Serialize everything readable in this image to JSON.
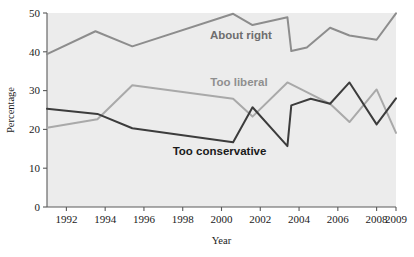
{
  "chart_data": {
    "type": "line",
    "title": "",
    "subtitle": "",
    "xlabel": "Year",
    "ylabel": "Percentage",
    "xlim": [
      1991,
      2009
    ],
    "ylim": [
      0,
      50
    ],
    "xticks": [
      1992,
      1994,
      1996,
      1998,
      2000,
      2002,
      2004,
      2006,
      2008,
      2009
    ],
    "yticks": [
      0,
      10,
      20,
      30,
      40,
      50
    ],
    "xtick_labels": [
      "1992",
      "1994",
      "1996",
      "1998",
      "2000",
      "2002",
      "2004",
      "2006",
      "2008",
      "2009"
    ],
    "ytick_labels": [
      "0",
      "10",
      "20",
      "30",
      "40",
      "50"
    ],
    "grid": false,
    "legend_position": "inline-annotations",
    "plot_background": "#ececec",
    "series": [
      {
        "name": "About right",
        "color": "#8d8d8d",
        "label_color": "#6e6e6e",
        "x": [
          1991,
          1993.5,
          1995.4,
          2000.6,
          2001.6,
          2003.4,
          2003.6,
          2004.4,
          2005.6,
          2006.6,
          2008,
          2009
        ],
        "values": [
          39.4,
          45.3,
          41.4,
          49.8,
          46.9,
          48.9,
          40.2,
          41.1,
          46.2,
          44.2,
          43.1,
          49.9
        ]
      },
      {
        "name": "Too liberal",
        "color": "#a9a9a9",
        "label_color": "#8f8f8f",
        "x": [
          1991,
          1993.6,
          1995.4,
          2000.6,
          2001.6,
          2003.4,
          2005.6,
          2006.6,
          2008,
          2009
        ],
        "values": [
          20.4,
          22.6,
          31.4,
          27.9,
          23.3,
          32.1,
          26.6,
          21.9,
          30.3,
          19.1
        ]
      },
      {
        "name": "Too conservative",
        "color": "#3c3c3c",
        "label_color": "#1a1a1a",
        "x": [
          1991,
          1993.6,
          1995.4,
          2000.6,
          2001.6,
          2003.4,
          2003.6,
          2004.6,
          2005.6,
          2006.6,
          2008,
          2009
        ],
        "values": [
          25.3,
          24.0,
          20.3,
          16.7,
          25.7,
          15.7,
          26.2,
          27.9,
          26.6,
          32.1,
          21.3,
          28.0
        ]
      }
    ],
    "annotations": [
      {
        "text": "About right",
        "x": 2001.0,
        "y": 43.3
      },
      {
        "text": "Too liberal",
        "x": 2000.9,
        "y": 31.3
      },
      {
        "text": "Too conservative",
        "x": 1999.9,
        "y": 13.4
      }
    ]
  }
}
